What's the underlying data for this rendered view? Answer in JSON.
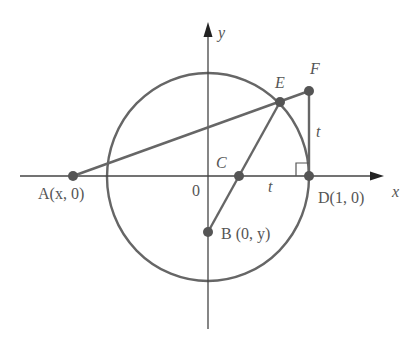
{
  "diagram": {
    "type": "geometry",
    "colors": {
      "stroke": "#666666",
      "axis": "#444444",
      "point": "#555555",
      "text": "#555555",
      "background": "#ffffff"
    },
    "axes": {
      "x_label": "x",
      "y_label": "y",
      "origin_label": "0"
    },
    "points": {
      "A": {
        "label": "A(x, 0)"
      },
      "B": {
        "label": "B (0, y)"
      },
      "C": {
        "label": "C"
      },
      "D": {
        "label": "D(1, 0)"
      },
      "E": {
        "label": "E"
      },
      "F": {
        "label": "F"
      }
    },
    "segment_labels": {
      "CD": "t",
      "DF": "t"
    },
    "annotations": {
      "right_angle_at": "D"
    }
  }
}
